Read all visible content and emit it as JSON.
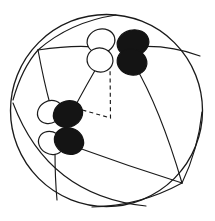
{
  "figure": {
    "background_color": "#ffffff",
    "line_color": "#1a1a1a",
    "lobe_fill_black": "#141414",
    "lobe_fill_white": "#ffffff",
    "width": 215,
    "height": 221
  },
  "chart_data": {
    "type": "diagram",
    "title": "",
    "xlabel": "",
    "ylabel": "",
    "sphere": {
      "center_x": 106.5,
      "center_y": 110.5,
      "radius": 96
    },
    "vertices": [
      {
        "id": "v-top-left",
        "x": 38,
        "y": 50,
        "label": ""
      },
      {
        "id": "v-upper-cluster",
        "x": 118,
        "y": 50,
        "label": ""
      },
      {
        "id": "v-lower-cluster",
        "x": 64,
        "y": 125,
        "label": ""
      },
      {
        "id": "v-bottom-right",
        "x": 182,
        "y": 183,
        "label": ""
      },
      {
        "id": "v-bottom-left",
        "x": 63,
        "y": 200,
        "label": ""
      },
      {
        "id": "v-right-edge",
        "x": 200,
        "y": 56,
        "label": ""
      }
    ],
    "edges": [
      {
        "from": "v-top-left",
        "to": "v-upper-cluster",
        "style": "solid"
      },
      {
        "from": "v-upper-cluster",
        "to": "v-right-edge",
        "style": "solid"
      },
      {
        "from": "v-top-left",
        "to": "v-lower-cluster",
        "style": "solid"
      },
      {
        "from": "v-lower-cluster",
        "to": "v-upper-cluster",
        "style": "solid"
      },
      {
        "from": "v-lower-cluster",
        "to": "v-bottom-left",
        "style": "solid"
      },
      {
        "from": "v-lower-cluster",
        "to": "v-bottom-right",
        "style": "solid"
      },
      {
        "from": "v-upper-cluster",
        "to": "v-bottom-right",
        "style": "solid"
      },
      {
        "from": "v-top-left",
        "to": "v-sphere-top",
        "style": "solid"
      },
      {
        "from": "v-top-left",
        "to": "v-sphere-lower-left",
        "style": "solid"
      }
    ],
    "dashed_path": {
      "style": "dashed",
      "points": [
        {
          "x": 110,
          "y": 64
        },
        {
          "x": 110.5,
          "y": 118
        },
        {
          "x": 72,
          "y": 107
        }
      ]
    },
    "lobe_clusters": [
      {
        "id": "upper-cluster",
        "center_x": 118,
        "center_y": 50,
        "lobes": [
          {
            "id": "upper-white-top",
            "cx": 101,
            "cy": 41,
            "rx": 14,
            "ry": 12,
            "rotation": -16,
            "fill": "white"
          },
          {
            "id": "upper-white-bottom",
            "cx": 100,
            "cy": 60,
            "rx": 13,
            "ry": 12,
            "rotation": 14,
            "fill": "white"
          },
          {
            "id": "upper-black-top",
            "cx": 133,
            "cy": 43,
            "rx": 16,
            "ry": 13,
            "rotation": -14,
            "fill": "black"
          },
          {
            "id": "upper-black-bottom",
            "cx": 132,
            "cy": 62,
            "rx": 15,
            "ry": 13,
            "rotation": 16,
            "fill": "black"
          }
        ]
      },
      {
        "id": "lower-cluster",
        "center_x": 64,
        "center_y": 125,
        "lobes": [
          {
            "id": "lower-white-top",
            "cx": 50,
            "cy": 112,
            "rx": 13,
            "ry": 11,
            "rotation": -30,
            "fill": "white"
          },
          {
            "id": "lower-white-bottom",
            "cx": 51,
            "cy": 143,
            "rx": 13,
            "ry": 11,
            "rotation": 30,
            "fill": "white"
          },
          {
            "id": "lower-black-top",
            "cx": 68,
            "cy": 114,
            "rx": 15,
            "ry": 13,
            "rotation": -26,
            "fill": "black"
          },
          {
            "id": "lower-black-bottom",
            "cx": 69,
            "cy": 141,
            "rx": 15,
            "ry": 13,
            "rotation": 26,
            "fill": "black"
          }
        ]
      }
    ],
    "legend": [],
    "annotations": []
  }
}
